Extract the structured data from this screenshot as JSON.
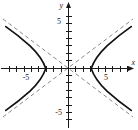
{
  "figure": {
    "kind": "coordinate-plane-graph",
    "background_color": "#ffffff",
    "curve_color": "#111111",
    "asymptote_color": "#7a7a7a",
    "axis_color": "#1a1a1a"
  },
  "axes": {
    "x_axis_name": "x",
    "y_axis_name": "y",
    "origin_px": {
      "x": 68,
      "y": 68
    },
    "pixels_per_unit": 7.4,
    "x_tick_labels": [
      "-5",
      "5"
    ],
    "y_tick_labels": [
      "5",
      "-5"
    ],
    "x_label_negative": "-5",
    "x_label_positive": "5",
    "y_label_positive": "5",
    "y_label_negative": "-5"
  },
  "chart_data": {
    "type": "line",
    "title": "",
    "subtitle": "",
    "xlabel": "x",
    "ylabel": "y",
    "xlim": [
      -9,
      9
    ],
    "ylim": [
      -8.5,
      8.5
    ],
    "grid": false,
    "legend": "none",
    "x_ticks": [
      -8,
      -7,
      -6,
      -5,
      -4,
      -3,
      -2,
      -1,
      0,
      1,
      2,
      3,
      4,
      5,
      6,
      7,
      8
    ],
    "y_ticks": [
      -8,
      -7,
      -6,
      -5,
      -4,
      -3,
      -2,
      -1,
      0,
      1,
      2,
      3,
      4,
      5,
      6,
      7,
      8
    ],
    "x_tick_labels_shown": {
      "-5": "-5",
      "5": "5"
    },
    "y_tick_labels_shown": {
      "5": "5",
      "-5": "-5"
    },
    "equation": "x^2/9 - y^2/5.06 = 1",
    "curve_kind": "hyperbola",
    "vertices": [
      [
        -3,
        0
      ],
      [
        3,
        0
      ]
    ],
    "asymptote_slopes": [
      0.75,
      -0.75
    ],
    "series": [
      {
        "name": "hyperbola-left-branch",
        "style": "solid",
        "points": [
          [
            -8.4,
            5.6
          ],
          [
            -8.0,
            5.2
          ],
          [
            -7.5,
            4.7
          ],
          [
            -7.0,
            4.2
          ],
          [
            -6.5,
            3.7
          ],
          [
            -6.0,
            3.2
          ],
          [
            -5.5,
            2.7
          ],
          [
            -5.0,
            2.2
          ],
          [
            -4.5,
            1.7
          ],
          [
            -4.2,
            1.4
          ],
          [
            -3.8,
            1.0
          ],
          [
            -3.4,
            0.6
          ],
          [
            -3.1,
            0.3
          ],
          [
            -3.0,
            0.0
          ],
          [
            -3.1,
            -0.3
          ],
          [
            -3.4,
            -0.6
          ],
          [
            -3.8,
            -1.0
          ],
          [
            -4.2,
            -1.4
          ],
          [
            -4.5,
            -1.7
          ],
          [
            -5.0,
            -2.2
          ],
          [
            -5.5,
            -2.7
          ],
          [
            -6.0,
            -3.2
          ],
          [
            -6.5,
            -3.7
          ],
          [
            -7.0,
            -4.2
          ],
          [
            -7.5,
            -4.7
          ],
          [
            -8.0,
            -5.2
          ],
          [
            -8.4,
            -5.6
          ]
        ]
      },
      {
        "name": "hyperbola-right-branch",
        "style": "solid",
        "points": [
          [
            8.4,
            5.6
          ],
          [
            8.0,
            5.2
          ],
          [
            7.5,
            4.7
          ],
          [
            7.0,
            4.2
          ],
          [
            6.5,
            3.7
          ],
          [
            6.0,
            3.2
          ],
          [
            5.5,
            2.7
          ],
          [
            5.0,
            2.2
          ],
          [
            4.5,
            1.7
          ],
          [
            4.2,
            1.4
          ],
          [
            3.8,
            1.0
          ],
          [
            3.4,
            0.6
          ],
          [
            3.1,
            0.3
          ],
          [
            3.0,
            0.0
          ],
          [
            3.1,
            -0.3
          ],
          [
            3.4,
            -0.6
          ],
          [
            3.8,
            -1.0
          ],
          [
            4.2,
            -1.4
          ],
          [
            4.5,
            -1.7
          ],
          [
            5.0,
            -2.2
          ],
          [
            5.5,
            -2.7
          ],
          [
            6.0,
            -3.2
          ],
          [
            6.5,
            -3.7
          ],
          [
            7.0,
            -4.2
          ],
          [
            7.5,
            -4.7
          ],
          [
            8.0,
            -5.2
          ],
          [
            8.4,
            -5.6
          ]
        ]
      },
      {
        "name": "asymptote-positive-slope",
        "style": "dashed",
        "points": [
          [
            -8.8,
            -6.6
          ],
          [
            8.8,
            6.6
          ]
        ]
      },
      {
        "name": "asymptote-negative-slope",
        "style": "dashed",
        "points": [
          [
            -8.8,
            6.6
          ],
          [
            8.8,
            -6.6
          ]
        ]
      }
    ]
  }
}
